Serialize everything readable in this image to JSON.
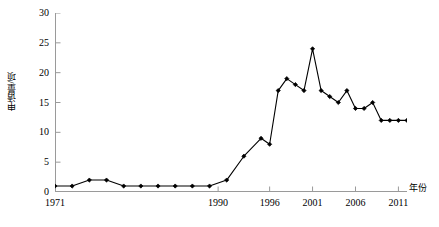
{
  "chart_data": {
    "type": "line",
    "title": "",
    "xlabel": "年份",
    "ylabel": "申请量/项",
    "xlim": [
      1971,
      2012
    ],
    "ylim": [
      0,
      30
    ],
    "ytick_values": [
      0,
      5,
      10,
      15,
      20,
      25,
      30
    ],
    "ytick_labels": [
      "0",
      "5",
      "10",
      "15",
      "20",
      "25",
      "30"
    ],
    "xtick_values": [
      1971,
      1990,
      1996,
      2001,
      2006,
      2011
    ],
    "xtick_labels": [
      "1971",
      "1990",
      "1996",
      "2001",
      "2006",
      "2011"
    ],
    "grid": false,
    "legend": "none",
    "marker": "filled-diamond",
    "line_color": "#000000",
    "marker_color": "#000000",
    "series": [
      {
        "name": "申请量",
        "x": [
          1971,
          1973,
          1975,
          1977,
          1979,
          1981,
          1983,
          1985,
          1987,
          1989,
          1991,
          1993,
          1995,
          1996,
          1997,
          1998,
          1999,
          2000,
          2001,
          2002,
          2003,
          2004,
          2005,
          2006,
          2007,
          2008,
          2009,
          2010,
          2011,
          2012
        ],
        "values": [
          1,
          1,
          2,
          2,
          1,
          1,
          1,
          1,
          1,
          1,
          2,
          6,
          9,
          8,
          17,
          19,
          18,
          17,
          24,
          17,
          16,
          15,
          17,
          14,
          14,
          15,
          12,
          12,
          12,
          12
        ]
      }
    ]
  },
  "axis": {
    "y_title": "申请量/项",
    "x_title": "年份"
  }
}
